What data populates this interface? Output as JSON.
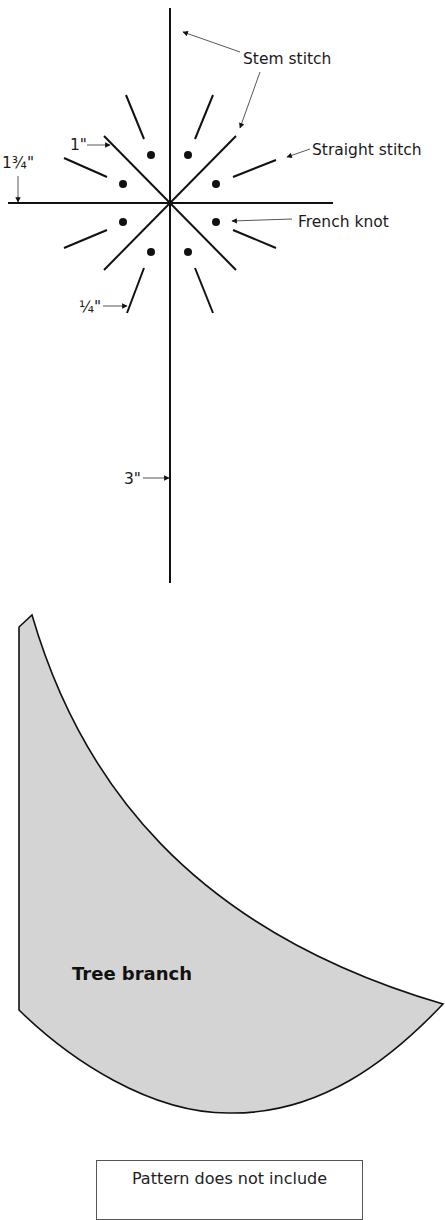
{
  "diagram": {
    "stitch_pattern": {
      "labels": {
        "stem_stitch": "Stem stitch",
        "straight_stitch": "Straight stitch",
        "french_knot": "French knot"
      },
      "measurements": {
        "one_inch": "1\"",
        "one_three_quarter_inch": "1¾\"",
        "quarter_inch": "¼\"",
        "three_inch": "3\""
      }
    },
    "template_shape": {
      "label": "Tree branch",
      "fill_color": "#d4d4d4",
      "stroke_color": "#111111"
    },
    "note": {
      "text": "Pattern does not include"
    }
  }
}
